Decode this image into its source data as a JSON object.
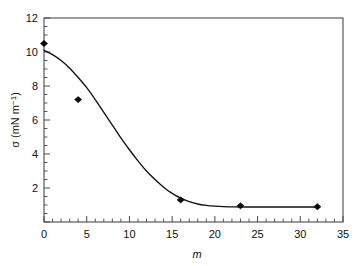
{
  "chart_data": {
    "type": "scatter",
    "title": "",
    "subtitle": "",
    "xlabel": "m",
    "ylabel": "σ (mN m⁻¹)",
    "ylabel_symbol": "σ",
    "ylabel_units": "(mN m⁻¹)",
    "xlim": [
      0,
      35
    ],
    "ylim": [
      0,
      12
    ],
    "x_major_ticks": [
      0,
      5,
      10,
      15,
      20,
      25,
      30,
      35
    ],
    "x_major_tick_labels": [
      "0",
      "5",
      "10",
      "15",
      "20",
      "25",
      "30",
      "35"
    ],
    "x_minor_tick_step": 1,
    "y_major_ticks": [
      0,
      2,
      4,
      6,
      8,
      10,
      12
    ],
    "y_major_tick_labels": [
      "0",
      "2",
      "4",
      "6",
      "8",
      "10",
      "12"
    ],
    "y_minor_tick_step": 0.5,
    "grid": false,
    "legend": false,
    "legend_position": "none",
    "frame": "box",
    "series": [
      {
        "name": "surface tension",
        "marker": "filled-diamond",
        "marker_color": "#0b0b0b",
        "line_color": "#101010",
        "x": [
          0,
          4,
          16,
          23,
          32
        ],
        "y": [
          10.5,
          7.2,
          1.3,
          0.95,
          0.9
        ],
        "points": [
          {
            "x": 0,
            "y": 10.5
          },
          {
            "x": 4,
            "y": 7.2
          },
          {
            "x": 16,
            "y": 1.3
          },
          {
            "x": 23,
            "y": 0.95
          },
          {
            "x": 32,
            "y": 0.9
          }
        ]
      }
    ],
    "fit_curve": {
      "name": "sigmoidal fit",
      "x": [
        0,
        1,
        2,
        3,
        4,
        5,
        6,
        7,
        8,
        9,
        10,
        11,
        12,
        13,
        14,
        15,
        16,
        17,
        18,
        19,
        20,
        21,
        22,
        23,
        24,
        25,
        26,
        27,
        28,
        29,
        30,
        31,
        32
      ],
      "y": [
        10.1,
        9.85,
        9.5,
        9.05,
        8.5,
        7.9,
        7.2,
        6.45,
        5.7,
        4.95,
        4.25,
        3.6,
        3.0,
        2.5,
        2.05,
        1.68,
        1.4,
        1.2,
        1.06,
        0.98,
        0.93,
        0.9,
        0.89,
        0.88,
        0.88,
        0.88,
        0.88,
        0.88,
        0.88,
        0.88,
        0.88,
        0.88,
        0.88
      ]
    },
    "colors": {
      "background": "#ffffff",
      "axis": "#4a4a4a",
      "text": "#111111",
      "data": "#0b0b0b"
    },
    "geometry": {
      "plot_left": 44,
      "plot_right": 343,
      "plot_top": 18,
      "plot_bottom": 222
    }
  }
}
